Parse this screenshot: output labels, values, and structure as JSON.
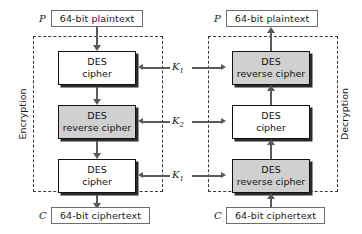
{
  "diagram": {
    "colors": {
      "process_white": "#ffffff",
      "process_gray": "#d0d0d0",
      "line": "#5a5a5a",
      "border": "#121212",
      "dashed_border": "#3a3a3a",
      "background": "#ffffff"
    }
  },
  "encryption": {
    "side_label": "Encryption",
    "input_symbol": "P",
    "input_box": "64-bit plaintext",
    "output_symbol": "C",
    "output_box": "64-bit ciphertext",
    "stages": [
      {
        "line1": "DES",
        "line2": "cipher",
        "fill": "white",
        "key": "K",
        "key_sub": "1"
      },
      {
        "line1": "DES",
        "line2": "reverse cipher",
        "fill": "gray",
        "key": "K",
        "key_sub": "2"
      },
      {
        "line1": "DES",
        "line2": "cipher",
        "fill": "white",
        "key": "K",
        "key_sub": "1"
      }
    ]
  },
  "decryption": {
    "side_label": "Decryption",
    "input_symbol": "C",
    "input_box": "64-bit ciphertext",
    "output_symbol": "P",
    "output_box": "64-bit plaintext",
    "stages": [
      {
        "line1": "DES",
        "line2": "reverse cipher",
        "fill": "gray",
        "key": "K",
        "key_sub": "1"
      },
      {
        "line1": "DES",
        "line2": "cipher",
        "fill": "white",
        "key": "K",
        "key_sub": "2"
      },
      {
        "line1": "DES",
        "line2": "reverse cipher",
        "fill": "gray",
        "key": "K",
        "key_sub": "1"
      }
    ]
  },
  "keys": [
    {
      "name": "K",
      "sub": "1"
    },
    {
      "name": "K",
      "sub": "2"
    },
    {
      "name": "K",
      "sub": "1"
    }
  ]
}
